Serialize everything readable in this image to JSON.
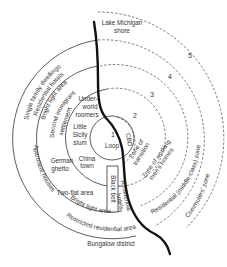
{
  "colors": {
    "line": "#333333",
    "river": "#111111",
    "background": "#ffffff"
  },
  "shore_label": [
    "Lake Michigan",
    "shore"
  ],
  "zone_numbers": [
    "1",
    "2",
    "3",
    "4",
    "5"
  ],
  "center_labels": {
    "number": "1",
    "loop": "Loop",
    "cbd": "CBD"
  },
  "zones_right": {
    "transition": [
      "Zone of",
      "transition"
    ],
    "working": [
      "Zone of working",
      "men's homes"
    ],
    "residential": "Residential (middle-class) zone",
    "commuters": "Commuters' zone"
  },
  "zone2_labels": {
    "underworld": [
      "Under-",
      "world",
      "roomers"
    ],
    "little_sicily": [
      "Little",
      "Sicily",
      "slum"
    ],
    "chinatown": [
      "China",
      "town"
    ],
    "german_ghetto": [
      "German",
      "ghetto"
    ],
    "black_belt": "Black belt"
  },
  "zone3_labels": {
    "second_immigrant": [
      "Second immigrant",
      "settlement"
    ],
    "two_flat": "Two-flat area",
    "residential_hotels": [
      "Residential",
      "hotels"
    ]
  },
  "zone4_labels": {
    "bright_light_top": "Bright light area",
    "residential_hotels_top": "Residential hotels",
    "single_family": "Single family dwellings",
    "apartment_houses": "Apartment houses",
    "bright_light_bottom": "Bright light area",
    "restricted": "Restricted residential area"
  },
  "outer_label": "Bungalow district"
}
